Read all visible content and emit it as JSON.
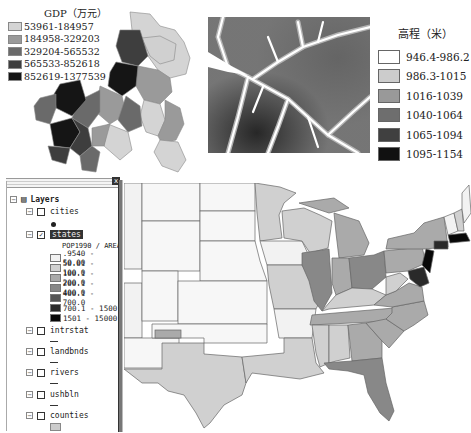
{
  "gdp_map": {
    "legend_title": "GDP（万元）",
    "classes": [
      {
        "label": "53961-184957",
        "color": "#d4d4d4"
      },
      {
        "label": "184958-329203",
        "color": "#9a9a9a"
      },
      {
        "label": "329204-565532",
        "color": "#6a6a6a"
      },
      {
        "label": "565533-852618",
        "color": "#3e3e3e"
      },
      {
        "label": "852619-1377539",
        "color": "#151515"
      }
    ]
  },
  "elevation_map": {
    "legend_title": "高程（米）",
    "classes": [
      {
        "label": "946.4-986.2",
        "color": "#ffffff"
      },
      {
        "label": "986.3-1015",
        "color": "#cccccc"
      },
      {
        "label": "1016-1039",
        "color": "#999999"
      },
      {
        "label": "1040-1064",
        "color": "#6e6e6e"
      },
      {
        "label": "1065-1094",
        "color": "#404040"
      },
      {
        "label": "1095-1154",
        "color": "#111111"
      }
    ]
  },
  "toc": {
    "close_label": "x",
    "root_label": "Layers",
    "layers": [
      {
        "name": "cities",
        "checked": false,
        "symbol": "point"
      },
      {
        "name": "states",
        "checked": true,
        "selected": true,
        "field": "POP1990 / AREA",
        "classes": [
          {
            "label": ".9540 - 50.00",
            "color": "#f2f2f2"
          },
          {
            "label": "50.01 - 100.0",
            "color": "#d0d0d0"
          },
          {
            "label": "100.1 - 200.0",
            "color": "#aaaaaa"
          },
          {
            "label": "200.1 - 400.0",
            "color": "#888888"
          },
          {
            "label": "400.1 - 700.0",
            "color": "#555555"
          },
          {
            "label": "700.1 - 1500",
            "color": "#2a2a2a"
          },
          {
            "label": "1501 - 15000",
            "color": "#080808"
          }
        ]
      },
      {
        "name": "intrstat",
        "checked": false,
        "symbol": "line"
      },
      {
        "name": "landbnds",
        "checked": false,
        "symbol": "line"
      },
      {
        "name": "rivers",
        "checked": false,
        "symbol": "line"
      },
      {
        "name": "ushbln",
        "checked": false,
        "symbol": "line"
      },
      {
        "name": "counties",
        "checked": false,
        "symbol": "fill"
      }
    ]
  },
  "us_map": {
    "title": "US states POP1990 / AREA choropleth"
  }
}
